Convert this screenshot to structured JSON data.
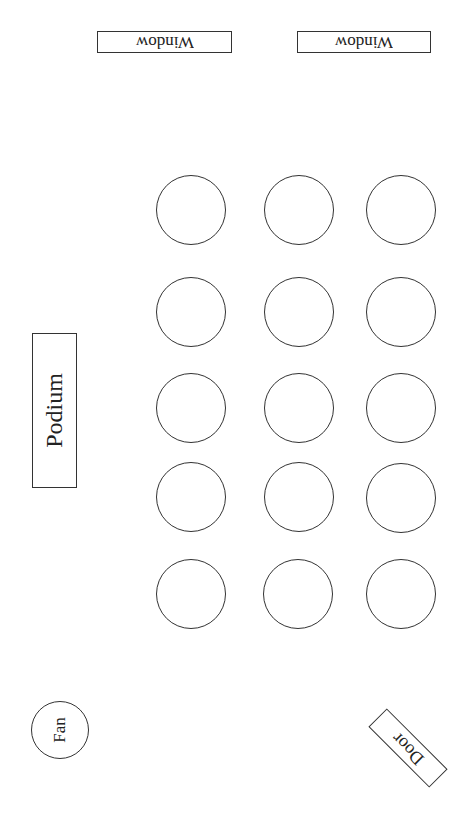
{
  "diagram": {
    "type": "classroom seating layout",
    "windows": [
      {
        "label": "Window",
        "x": 97,
        "y": 31,
        "w": 135
      },
      {
        "label": "Window",
        "x": 297,
        "y": 31,
        "w": 134
      }
    ],
    "tables": {
      "rows": 5,
      "columns": 3,
      "column_centers_x": [
        191,
        299,
        401
      ],
      "row_centers_y": [
        210,
        312,
        413,
        498,
        594
      ],
      "count": 15
    },
    "podium": {
      "label": "Podium"
    },
    "fan": {
      "label": "Fan"
    },
    "door": {
      "label": "Door"
    }
  }
}
